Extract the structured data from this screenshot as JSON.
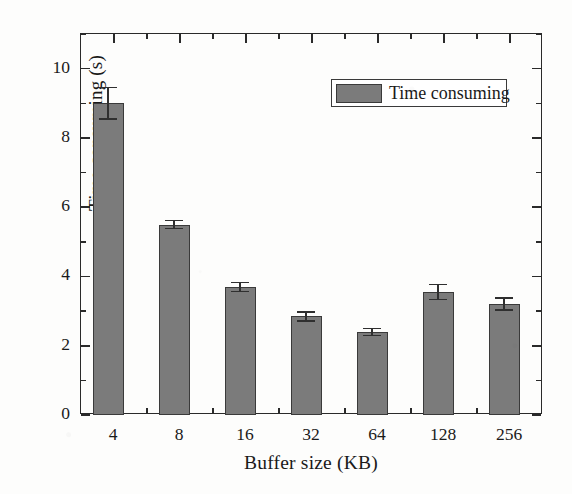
{
  "chart_data": {
    "type": "bar",
    "title": "",
    "categories": [
      "4",
      "8",
      "16",
      "32",
      "64",
      "128",
      "256"
    ],
    "values": [
      9.0,
      5.5,
      3.7,
      2.85,
      2.4,
      3.55,
      3.2
    ],
    "errors": [
      0.45,
      0.12,
      0.13,
      0.13,
      0.1,
      0.22,
      0.17
    ],
    "series": [
      {
        "name": "Time consuming",
        "values": [
          9.0,
          5.5,
          3.7,
          2.85,
          2.4,
          3.55,
          3.2
        ]
      }
    ],
    "xlabel": "Buffer size (KB)",
    "ylabel": "Time consuming (s)",
    "ylim": [
      0,
      11
    ],
    "ytick_labels": [
      "0",
      "2",
      "4",
      "6",
      "8",
      "10"
    ],
    "ytick_values": [
      0,
      2,
      4,
      6,
      8,
      10
    ],
    "yminor_values": [
      1,
      3,
      5,
      7,
      9,
      11
    ],
    "xtick_labels": [
      "4",
      "8",
      "16",
      "32",
      "64",
      "128",
      "256"
    ],
    "grid": false,
    "legend_position": "top-right",
    "legend_entries": [
      "Time consuming"
    ],
    "bar_color": "#7b7b7b",
    "bar_edge_color": "#3a3a3a",
    "axis_color": "#2a2a2a"
  },
  "legend": {
    "label": "Time consuming"
  },
  "axes": {
    "x_title": "Buffer size (KB)",
    "y_title": "Time consuming (s)"
  }
}
